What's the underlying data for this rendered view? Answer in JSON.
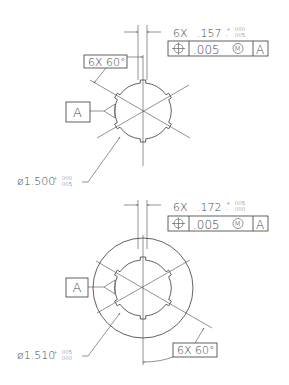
{
  "top_view": {
    "width_callout": {
      "count": "6X",
      "value": ".157",
      "upper_tol": "+ .000",
      "lower_tol": "- .005",
      "plus": "+",
      "minus": "-",
      "upper": ".000",
      "lower": ".005"
    },
    "fcf": {
      "symbol": "position-icon",
      "tolerance": ".005",
      "modifier": "M",
      "datum": "A"
    },
    "angle_callout": "6X 60°",
    "datum_label": "A",
    "diameter_callout": {
      "value": "ø1.500",
      "plus": "+",
      "minus": "-",
      "upper": ".000",
      "lower": ".005"
    }
  },
  "bottom_view": {
    "width_callout": {
      "count": "6X",
      "value": ".172",
      "plus": "+",
      "minus": "-",
      "upper": ".005",
      "lower": ".000"
    },
    "fcf": {
      "symbol": "position-icon",
      "tolerance": ".005",
      "modifier": "M",
      "datum": "A"
    },
    "angle_callout": "6X 60°",
    "datum_label": "A",
    "diameter_callout": {
      "value": "ø1.510",
      "plus": "+",
      "minus": "-",
      "upper": ".005",
      "lower": ".000"
    }
  },
  "colors": {
    "line": "#3a3a3a",
    "text": "#444444",
    "background": "#ffffff"
  }
}
